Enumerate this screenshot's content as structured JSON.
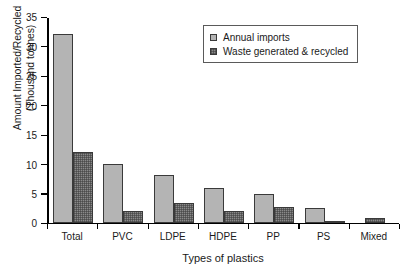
{
  "chart_data": {
    "type": "bar",
    "title": "",
    "xlabel": "Types of plastics",
    "ylabel": "Amount Imported/Recycled (Thousand tonnes)",
    "ylabel_lines": [
      "Amount Imported/Recycled",
      "(Thousand tonnes)"
    ],
    "categories": [
      "Total",
      "PVC",
      "LDPE",
      "HDPE",
      "PP",
      "PS",
      "Mixed"
    ],
    "series": [
      {
        "name": "Annual imports",
        "color": "#b4b4b4",
        "values": [
          32,
          10,
          8,
          5.8,
          4.8,
          2.5,
          null
        ]
      },
      {
        "name": "Waste generated & recycled",
        "color": "#8a8a8a",
        "values": [
          12,
          2,
          3.3,
          2,
          2.6,
          0.2,
          0.7
        ]
      }
    ],
    "ylim": [
      0,
      35
    ],
    "yticks": [
      0,
      5,
      10,
      15,
      20,
      25,
      30,
      35
    ],
    "ytick_labels": [
      "0",
      "5",
      "10",
      "15",
      "20",
      "25",
      "30",
      "35"
    ],
    "grid": false,
    "legend_position": "top-right",
    "legend_entries": [
      "Annual imports",
      "Waste generated & recycled"
    ]
  }
}
